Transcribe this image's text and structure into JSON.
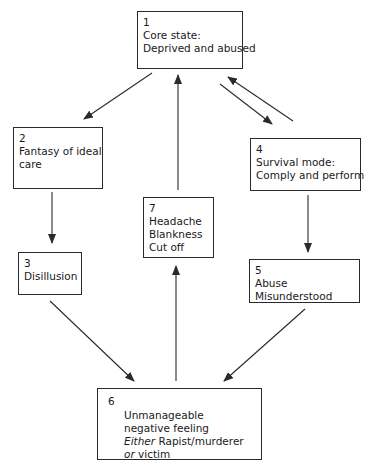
{
  "diagram": {
    "nodes": [
      {
        "id": "1",
        "number": "1",
        "lines": [
          "Core state:",
          "Deprived and abused"
        ]
      },
      {
        "id": "2",
        "number": "2",
        "lines": [
          "Fantasy of ideal",
          "care"
        ]
      },
      {
        "id": "3",
        "number": "3",
        "lines": [
          "Disillusion"
        ]
      },
      {
        "id": "4",
        "number": "4",
        "lines": [
          "Survival mode:",
          "Comply and perform"
        ]
      },
      {
        "id": "5",
        "number": "5",
        "lines": [
          "Abuse",
          "Misunderstood"
        ]
      },
      {
        "id": "6",
        "number": "6",
        "lines": [
          "Unmanageable",
          "negative feeling"
        ],
        "either_word": "Either",
        "either_rest": " Rapist/murderer",
        "or_word": "or",
        "or_rest": " victim"
      },
      {
        "id": "7",
        "number": "7",
        "lines": [
          "Headache",
          "Blankness",
          "Cut off"
        ]
      }
    ],
    "edges": [
      {
        "from": "1",
        "to": "2"
      },
      {
        "from": "1",
        "to": "4"
      },
      {
        "from": "4",
        "to": "1"
      },
      {
        "from": "2",
        "to": "3"
      },
      {
        "from": "4",
        "to": "5"
      },
      {
        "from": "3",
        "to": "6"
      },
      {
        "from": "5",
        "to": "6"
      },
      {
        "from": "6",
        "to": "7"
      },
      {
        "from": "7",
        "to": "1"
      }
    ],
    "colors": {
      "line": "#2a2a2a",
      "background": "#ffffff",
      "text": "#1a1a1a"
    }
  }
}
